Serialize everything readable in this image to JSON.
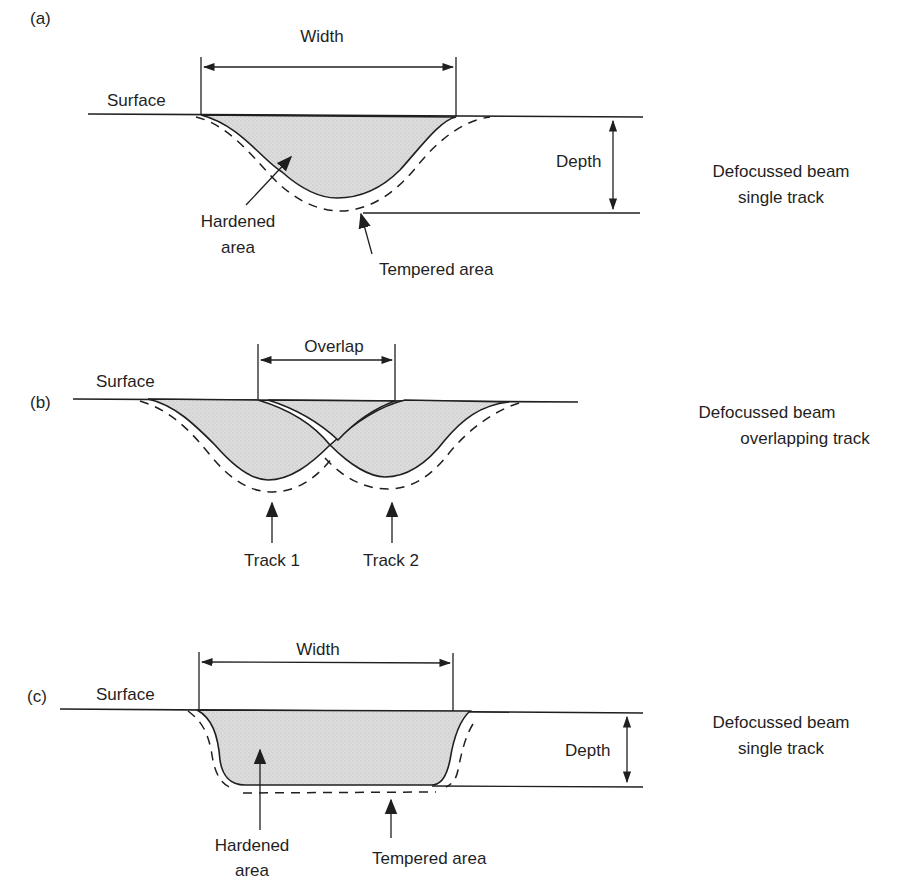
{
  "figure": {
    "panels": [
      {
        "id": "a",
        "label": "(a)",
        "surface_label": "Surface",
        "width_label": "Width",
        "depth_label": "Depth",
        "hardened_label_line1": "Hardened",
        "hardened_label_line2": "area",
        "tempered_label": "Tempered area",
        "caption_line1": "Defocussed beam",
        "caption_line2": "single track",
        "profile": "v-shaped"
      },
      {
        "id": "b",
        "label": "(b)",
        "surface_label": "Surface",
        "overlap_label": "Overlap",
        "track1_label": "Track 1",
        "track2_label": "Track 2",
        "caption_line1": "Defocussed beam",
        "caption_line2": "overlapping track",
        "profile": "two overlapping v-shaped tracks"
      },
      {
        "id": "c",
        "label": "(c)",
        "surface_label": "Surface",
        "width_label": "Width",
        "depth_label": "Depth",
        "hardened_label_line1": "Hardened",
        "hardened_label_line2": "area",
        "tempered_label": "Tempered area",
        "caption_line1": "Defocussed beam",
        "caption_line2": "single track",
        "profile": "flat-bottomed"
      }
    ],
    "colors": {
      "ink": "#1f1f1f",
      "hardened_fill": "#d9d9d9",
      "background": "#ffffff"
    }
  }
}
